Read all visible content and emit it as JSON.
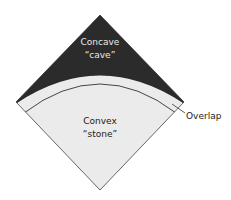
{
  "diagram": {
    "regions": [
      {
        "id": "concave",
        "line1": "Concave",
        "line2": "“cave”",
        "fill": "#2b2b2b",
        "text_color": "#e8e8e8"
      },
      {
        "id": "convex",
        "line1": "Convex",
        "line2": "“stone”",
        "fill": "#ebebeb",
        "text_color": "#222222"
      }
    ],
    "callout": {
      "label": "Overlap",
      "color": "#222222"
    },
    "colors": {
      "outline": "#555555",
      "arc_line": "#444444",
      "background": "#ffffff"
    }
  }
}
